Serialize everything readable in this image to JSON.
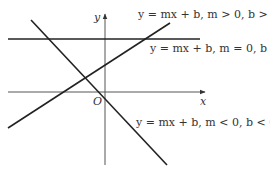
{
  "diagram": {
    "axes": {
      "x_label": "x",
      "y_label": "y",
      "origin_label": "O"
    },
    "lines": [
      {
        "name": "positive-slope",
        "label": "y = mx + b, m > 0, b > 0",
        "x1": 8,
        "y1": 128,
        "x2": 170,
        "y2": 23
      },
      {
        "name": "zero-slope",
        "label": "y = mx + b, m = 0, b > 0",
        "x1": 8,
        "y1": 39,
        "x2": 200,
        "y2": 39
      },
      {
        "name": "negative-slope",
        "label": "y = mx + b, m < 0, b < 0",
        "x1": 31,
        "y1": 20,
        "x2": 167,
        "y2": 165
      }
    ],
    "colors": {
      "line": "#222222",
      "axis": "#555555",
      "text": "#333333"
    }
  }
}
